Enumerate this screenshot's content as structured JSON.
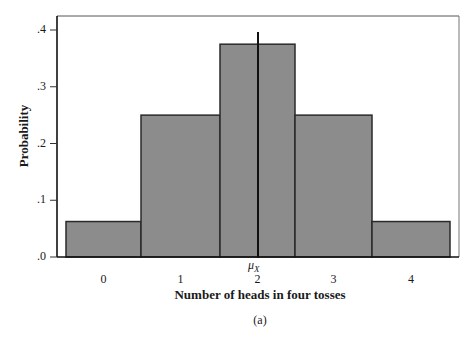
{
  "figure": {
    "caption": "(a)",
    "mean_label": "μ",
    "mean_subscript": "X"
  },
  "chart_data": {
    "type": "bar",
    "title": "",
    "xlabel": "Number of heads in four tosses",
    "ylabel": "Probability",
    "categories": [
      "0",
      "1",
      "2",
      "3",
      "4"
    ],
    "values": [
      0.0625,
      0.25,
      0.375,
      0.25,
      0.0625
    ],
    "ylim": [
      0,
      0.42
    ],
    "yticks": [
      ".0",
      ".1",
      ".2",
      ".3",
      ".4"
    ],
    "ytick_values": [
      0,
      0.1,
      0.2,
      0.3,
      0.4
    ],
    "grid": false,
    "legend": null,
    "annotations": [
      {
        "text": "μX",
        "x": 2,
        "type": "vertical-line",
        "meaning": "mean"
      }
    ],
    "bar_color": "#8c8c8c",
    "edge_color": "#2a2a2a"
  }
}
